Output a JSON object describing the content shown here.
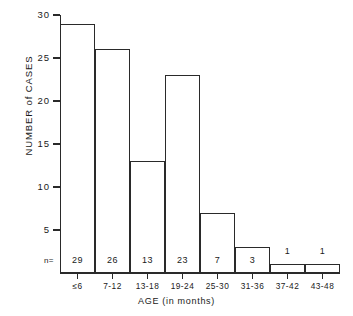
{
  "chart_data": {
    "type": "bar",
    "title": "",
    "xlabel": "AGE  (in months)",
    "ylabel": "NUMBER of CASES",
    "categories": [
      "≤6",
      "7-12",
      "13-18",
      "19-24",
      "25-30",
      "31-36",
      "37-42",
      "43-48"
    ],
    "values": [
      29,
      26,
      13,
      23,
      7,
      3,
      1,
      1
    ],
    "ylim": [
      0,
      30
    ],
    "yticks": [
      5,
      10,
      15,
      20,
      25,
      30
    ],
    "ytick_labels": [
      "5",
      "10",
      "15",
      "20",
      "25",
      "30"
    ],
    "grid": false,
    "legend": null,
    "annotations": {
      "n_prefix": "n=",
      "n_values": [
        "29",
        "26",
        "13",
        "23",
        "7",
        "3",
        "1",
        "1"
      ]
    },
    "style": {
      "bar_fill": "#ffffff",
      "bar_edge": "#2a2a2a",
      "background": "#ffffff",
      "text_color": "#1a1a1a"
    }
  }
}
